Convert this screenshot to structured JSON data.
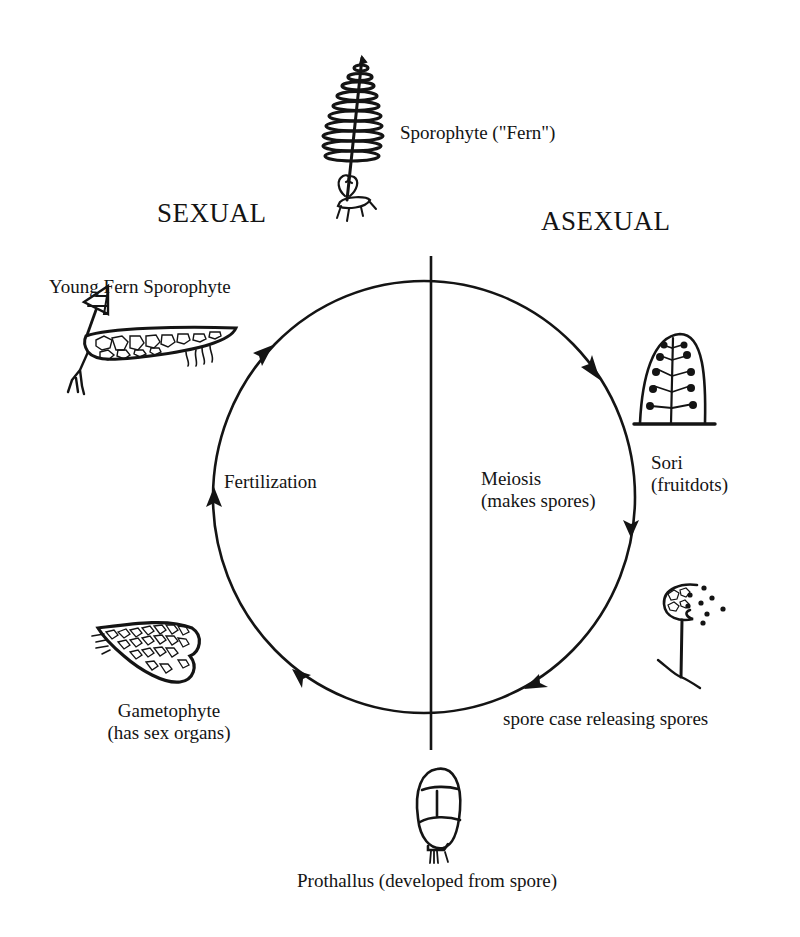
{
  "diagram": {
    "title_left": "SEXUAL",
    "title_right": "ASEXUAL",
    "colors": {
      "ink": "#141414",
      "background": "#ffffff"
    },
    "cycle": {
      "shape": "circle",
      "center": [
        424,
        497
      ],
      "radius": [
        211,
        216
      ],
      "direction": "clockwise",
      "divider": "vertical line separating sexual (left) and asexual (right) halves"
    },
    "stages": [
      {
        "id": "sporophyte",
        "label": "Sporophyte (\"Fern\")",
        "icon": "fern-sporophyte-icon",
        "position": "top"
      },
      {
        "id": "sori",
        "label_line1": "Sori",
        "label_line2": "(fruitdots)",
        "icon": "sori-frond-icon",
        "position": "right-upper"
      },
      {
        "id": "spore-case",
        "label": "spore case releasing spores",
        "icon": "spore-case-icon",
        "position": "right-lower"
      },
      {
        "id": "prothallus",
        "label": "Prothallus (developed from spore)",
        "icon": "prothallus-icon",
        "position": "bottom"
      },
      {
        "id": "gametophyte",
        "label_line1": "Gametophyte",
        "label_line2": "(has sex organs)",
        "icon": "gametophyte-icon",
        "position": "left-lower"
      },
      {
        "id": "young-sporophyte",
        "label": "Young Fern Sporophyte",
        "icon": "young-sporophyte-icon",
        "position": "left-upper"
      }
    ],
    "processes": [
      {
        "id": "fertilization",
        "label": "Fertilization",
        "side": "sexual"
      },
      {
        "id": "meiosis",
        "label_line1": "Meiosis",
        "label_line2": "(makes spores)",
        "side": "asexual"
      }
    ]
  }
}
